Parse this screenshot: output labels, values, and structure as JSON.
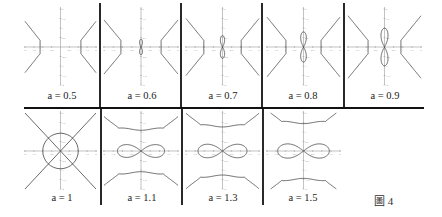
{
  "figure": {
    "caption": "圖 4",
    "axis": {
      "x_ticks": [
        "-2",
        "-1.5",
        "-1",
        "-0.5",
        "0.5",
        "1",
        "1.5",
        "2"
      ],
      "y_ticks": [
        "2",
        "1.5",
        "1",
        "0.5",
        "-0.5",
        "-1",
        "-1.5",
        "-2"
      ],
      "range": [
        -2,
        2
      ]
    },
    "colors": {
      "curve": "#444444",
      "axis": "#9a9a9a",
      "divider": "#111111",
      "text": "#222222"
    },
    "panels": [
      {
        "label": "a = 0.5",
        "a": 0.5,
        "row": 0,
        "col": 0
      },
      {
        "label": "a = 0.6",
        "a": 0.6,
        "row": 0,
        "col": 1
      },
      {
        "label": "a = 0.7",
        "a": 0.7,
        "row": 0,
        "col": 2
      },
      {
        "label": "a = 0.8",
        "a": 0.8,
        "row": 0,
        "col": 3
      },
      {
        "label": "a = 0.9",
        "a": 0.9,
        "row": 0,
        "col": 4
      },
      {
        "label": "a = 1",
        "a": 1.0,
        "row": 1,
        "col": 0
      },
      {
        "label": "a = 1.1",
        "a": 1.1,
        "row": 1,
        "col": 1
      },
      {
        "label": "a = 1.3",
        "a": 1.3,
        "row": 1,
        "col": 2
      },
      {
        "label": "a = 1.5",
        "a": 1.5,
        "row": 1,
        "col": 3
      }
    ]
  }
}
